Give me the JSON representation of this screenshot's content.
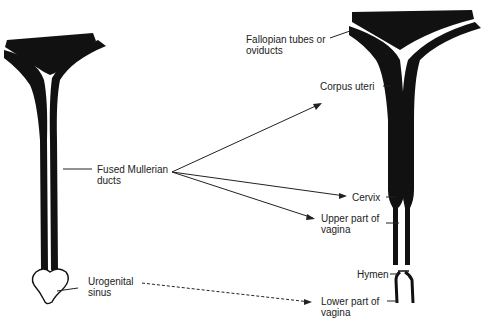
{
  "colors": {
    "ink": "#111111",
    "background": "#ffffff"
  },
  "left_structure": {
    "labels": {
      "fused_mullerian_1": "Fused Mullerian",
      "fused_mullerian_2": "ducts",
      "urogenital_1": "Urogenital",
      "urogenital_2": "sinus"
    }
  },
  "right_structure": {
    "labels": {
      "fallopian_1": "Fallopian tubes or",
      "fallopian_2": "oviducts",
      "corpus_uteri": "Corpus uteri",
      "cervix": "Cervix",
      "upper_vagina_1": "Upper part of",
      "upper_vagina_2": "vagina",
      "hymen": "Hymen",
      "lower_vagina_1": "Lower part of",
      "lower_vagina_2": "vagina"
    }
  }
}
